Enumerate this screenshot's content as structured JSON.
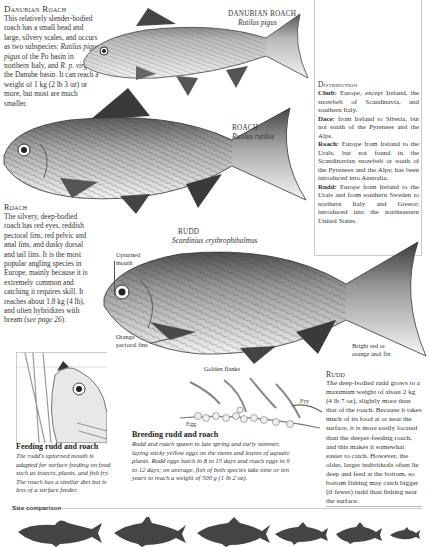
{
  "danubian_roach": {
    "title": "Danubian Roach",
    "body_parts": [
      {
        "text": "This relatively slender-bodied roach has a small head and large, silvery scales, and occurs as two subspecies: ",
        "italic": false
      },
      {
        "text": "Rutilus pigus pigus",
        "italic": true
      },
      {
        "text": " of the Po basin in northern Italy, and ",
        "italic": false
      },
      {
        "text": "R. p. virgo",
        "italic": true
      },
      {
        "text": " of the Danube basin. It can reach a weight of 1 kg (2 lb 3 oz) or more, but most are much smaller.",
        "italic": false
      }
    ],
    "label_name": "DANUBIAN ROACH",
    "label_latin": "Rutilus pigus"
  },
  "roach": {
    "title": "Roach",
    "body_pre": "The silvery, deep-bodied roach has red eyes, reddish pectoral fins, red pelvic and anal fins, and dusky dorsal and tail fins. It is the most popular angling species in Europe, mainly because it is extremely common and catching it requires skill. It reaches about 1.8 kg (4 lb), and often hybridizes with bream (",
    "body_ref": "see page 26",
    "body_post": ").",
    "label_name": "ROACH",
    "label_latin": "Rutilus rutilus"
  },
  "rudd": {
    "label_name": "RUDD",
    "label_latin": "Scardinius erythrophthalmus",
    "title": "Rudd",
    "body": "The deep-bodied rudd grows to a maximum weight of about 2 kg (4 lb 7 oz), slightly more than that of the roach. Because it takes much of its food at or near the surface, it is more easily located than the deeper-feeding roach, and this makes it somewhat easier to catch. However, the older, larger individuals often lie deep and feed at the bottom, so bottom fishing may catch bigger (if fewer) rudd than fishing near the surface."
  },
  "annotations": {
    "upturned_mouth": "Upturned mouth",
    "orange_pectoral": "Orange pectoral fins",
    "golden_flanks": "Golden flanks",
    "bright_red_anal": "Bright red or orange anal fin",
    "egg": "Egg",
    "fry": "Fry"
  },
  "distribution": {
    "title": "Distribution",
    "entries": [
      {
        "name": "Chub:",
        "text": " Europe, except Ireland, the snowbelt of Scandinavia, and southern Italy."
      },
      {
        "name": "Dace:",
        "text": " from Ireland to Siberia, but not south of the Pyrenees and the Alps."
      },
      {
        "name": "Roach:",
        "text": " Europe from Ireland to the Urals, but not found in the Scandinavian snowbelt or south of the Pyrenees and the Alps; has been introduced into Australia."
      },
      {
        "name": "Rudd:",
        "text": " Europe from Ireland to the Urals and from southern Sweden to northern Italy and Greece; introduced into the northeastern United States."
      }
    ]
  },
  "feeding": {
    "title": "Feeding rudd and roach",
    "body": "The rudd's upturned mouth is adapted for surface feeding on food such as insects, plants, and fish fry. The roach has a similar diet but is less of a surface feeder."
  },
  "breeding": {
    "title": "Breeding rudd and roach",
    "body": "Rudd and roach spawn in late spring and early summer, laying sticky yellow eggs on the stems and leaves of aquatic plants. Rudd eggs hatch in 8 to 15 days and roach eggs in 9 to 12 days; on average, fish of both species take nine or ten years to reach a weight of 500 g (1 lb 2 oz)."
  },
  "size_comparison": {
    "title": "Size comparison",
    "silhouettes": [
      "chub",
      "rudd",
      "roach",
      "danubian-roach",
      "dace",
      "small-fish"
    ]
  },
  "colors": {
    "text": "#333333",
    "rule": "#bbbbbb",
    "silhouette": "#444444",
    "fish_dark": "#3a3a3a"
  }
}
